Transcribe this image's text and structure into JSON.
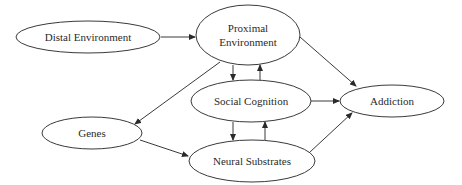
{
  "diagram": {
    "type": "directed-graph",
    "nodes": [
      {
        "id": "distal",
        "label": "Distal Environment"
      },
      {
        "id": "proximal",
        "label_line1": "Proximal",
        "label_line2": "Environment"
      },
      {
        "id": "social",
        "label": "Social Cognition"
      },
      {
        "id": "genes",
        "label": "Genes"
      },
      {
        "id": "neural",
        "label": "Neural Substrates"
      },
      {
        "id": "addiction",
        "label": "Addiction"
      }
    ],
    "edges": [
      {
        "from": "Distal Environment",
        "to": "Proximal Environment"
      },
      {
        "from": "Proximal Environment",
        "to": "Addiction"
      },
      {
        "from": "Proximal Environment",
        "to": "Genes"
      },
      {
        "from": "Proximal Environment",
        "to": "Social Cognition"
      },
      {
        "from": "Social Cognition",
        "to": "Proximal Environment"
      },
      {
        "from": "Social Cognition",
        "to": "Addiction"
      },
      {
        "from": "Social Cognition",
        "to": "Neural Substrates"
      },
      {
        "from": "Neural Substrates",
        "to": "Social Cognition"
      },
      {
        "from": "Genes",
        "to": "Neural Substrates"
      },
      {
        "from": "Neural Substrates",
        "to": "Addiction"
      }
    ]
  }
}
